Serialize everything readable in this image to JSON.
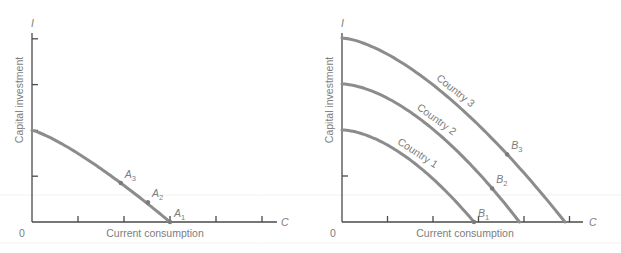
{
  "chart_data": [
    {
      "type": "line",
      "title": "",
      "xlabel": "Current consumption",
      "ylabel": "Capital investment",
      "x_axis_symbol": "C",
      "y_axis_symbol": "I",
      "origin_label": "0",
      "xlim": [
        0,
        5.4
      ],
      "ylim": [
        0,
        4.2
      ],
      "x_ticks": [
        1,
        2,
        3,
        4,
        5
      ],
      "y_ticks": [
        1,
        2,
        3,
        4
      ],
      "grid": false,
      "series": [
        {
          "name": "PPF",
          "label": "",
          "intercept_y": 2,
          "intercept_x": 3,
          "points": [
            {
              "name": "A",
              "sub": "3",
              "x": 1.93,
              "y": 0.85
            },
            {
              "name": "A",
              "sub": "2",
              "x": 2.52,
              "y": 0.43
            },
            {
              "name": "A",
              "sub": "1",
              "x": 3.0,
              "y": 0.0
            }
          ]
        }
      ]
    },
    {
      "type": "line",
      "title": "",
      "xlabel": "Current consumption",
      "ylabel": "Capital investment",
      "x_axis_symbol": "C",
      "y_axis_symbol": "I",
      "origin_label": "0",
      "xlim": [
        0,
        5.4
      ],
      "ylim": [
        0,
        4.2
      ],
      "x_ticks": [
        1,
        2,
        3,
        4,
        5
      ],
      "y_ticks": [
        1,
        2,
        3,
        4
      ],
      "grid": false,
      "series": [
        {
          "name": "Country 1",
          "label": "Country 1",
          "intercept_y": 2,
          "intercept_x": 2.9,
          "points": [
            {
              "name": "B",
              "sub": "1",
              "x": 2.9,
              "y": 0.0
            }
          ]
        },
        {
          "name": "Country 2",
          "label": "Country 2",
          "intercept_y": 3,
          "intercept_x": 3.9,
          "points": [
            {
              "name": "B",
              "sub": "2",
              "x": 3.3,
              "y": 0.73
            }
          ]
        },
        {
          "name": "Country 3",
          "label": "Country 3",
          "intercept_y": 4,
          "intercept_x": 4.9,
          "points": [
            {
              "name": "B",
              "sub": "3",
              "x": 3.63,
              "y": 1.47
            }
          ]
        }
      ]
    }
  ],
  "colors": {
    "axis": "#4a4a4a",
    "curve": "#8c8c8c",
    "text": "#7d7d7d"
  }
}
